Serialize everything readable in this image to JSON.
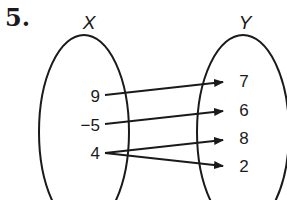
{
  "problem": {
    "number": "5."
  },
  "sets": {
    "domain": {
      "label": "X",
      "elements": [
        "9",
        "−5",
        "4"
      ]
    },
    "range": {
      "label": "Y",
      "elements": [
        "7",
        "6",
        "8",
        "2"
      ]
    }
  },
  "mappings": [
    {
      "from": "9",
      "to": "7"
    },
    {
      "from": "−5",
      "to": "6"
    },
    {
      "from": "4",
      "to": "8"
    },
    {
      "from": "4",
      "to": "2"
    }
  ]
}
